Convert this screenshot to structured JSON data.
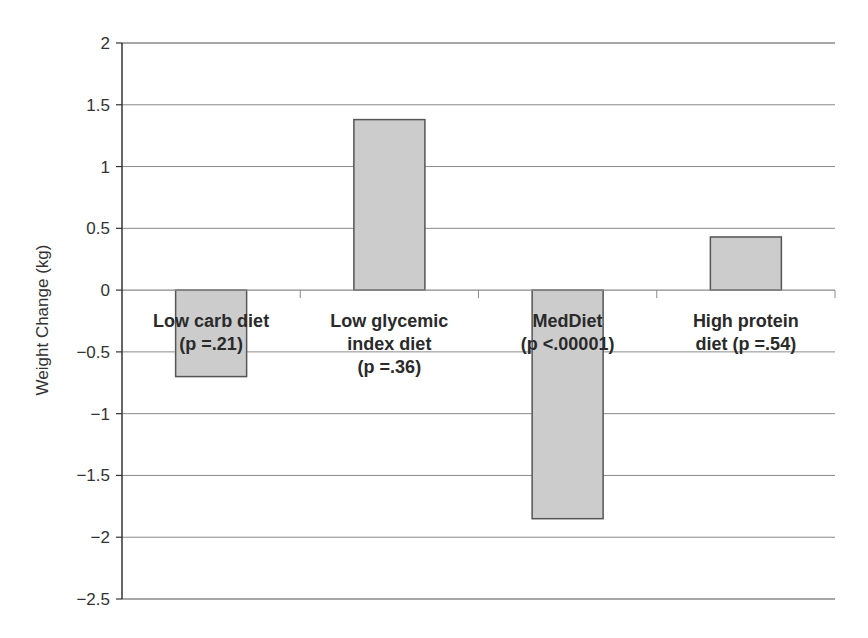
{
  "chart_data": {
    "type": "bar",
    "title": "",
    "xlabel": "",
    "ylabel": "Weight Change (kg)",
    "ylim": [
      -2.5,
      2
    ],
    "yticks": [
      2,
      1.5,
      1,
      0.5,
      0,
      -0.5,
      -1,
      -1.5,
      -2,
      -2.5
    ],
    "ytick_labels": [
      "2",
      "1.5",
      "1",
      "0.5",
      "0",
      "−0.5",
      "−1",
      "−1.5",
      "−2",
      "−2.5"
    ],
    "grid": true,
    "legend": "none",
    "categories": [
      "Low carb diet (p =.21)",
      "Low glycemic index diet (p =.36)",
      "MedDiet (p <.00001)",
      "High protein diet (p =.54)"
    ],
    "category_label_lines": [
      [
        "Low carb diet",
        "(p =.21)"
      ],
      [
        "Low glycemic",
        "index diet",
        "(p =.36)"
      ],
      [
        "MedDiet",
        "(p <.00001)"
      ],
      [
        "High protein",
        "diet (p =.54)"
      ]
    ],
    "values": [
      -0.7,
      1.38,
      -1.85,
      0.43
    ],
    "bar_color": "#cccccc",
    "bar_edge_color": "#555555",
    "grid_color": "#8a8a8a"
  }
}
